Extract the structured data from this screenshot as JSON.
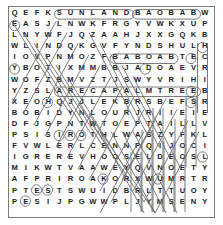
{
  "puzzle": {
    "type": "word-search",
    "title": "Word Search Puzzle Grid",
    "columns": 18,
    "rows": 18,
    "grid": [
      [
        "Q",
        "E",
        "F",
        "K",
        "S",
        "U",
        "N",
        "L",
        "A",
        "N",
        "D",
        "B",
        "A",
        "O",
        "B",
        "A",
        "B",
        "W"
      ],
      [
        "E",
        "A",
        "S",
        "J",
        "L",
        "N",
        "W",
        "K",
        "F",
        "R",
        "G",
        "Y",
        "V",
        "W",
        "K",
        "X",
        "U",
        "P"
      ],
      [
        "L",
        "N",
        "Y",
        "W",
        "F",
        "J",
        "Q",
        "Z",
        "A",
        "A",
        "H",
        "J",
        "X",
        "X",
        "G",
        "Q",
        "K",
        "B"
      ],
      [
        "W",
        "L",
        "I",
        "N",
        "D",
        "Q",
        "K",
        "G",
        "V",
        "F",
        "Y",
        "N",
        "D",
        "S",
        "H",
        "U",
        "L",
        "H"
      ],
      [
        "I",
        "O",
        "V",
        "P",
        "N",
        "M",
        "O",
        "Z",
        "F",
        "B",
        "A",
        "B",
        "O",
        "A",
        "B",
        "T",
        "E",
        "C"
      ],
      [
        "Y",
        "B",
        "O",
        "T",
        "I",
        "X",
        "M",
        "M",
        "B",
        "B",
        "J",
        "A",
        "D",
        "O",
        "A",
        "E",
        "V",
        "R"
      ],
      [
        "W",
        "O",
        "F",
        "Z",
        "B",
        "M",
        "V",
        "Z",
        "T",
        "J",
        "S",
        "W",
        "Y",
        "V",
        "R",
        "I",
        "H",
        "I"
      ],
      [
        "Y",
        "Z",
        "S",
        "L",
        "A",
        "R",
        "E",
        "C",
        "A",
        "P",
        "A",
        "L",
        "M",
        "T",
        "R",
        "E",
        "E",
        "B"
      ],
      [
        "X",
        "E",
        "O",
        "H",
        "Q",
        "J",
        "J",
        "L",
        "E",
        "K",
        "B",
        "R",
        "S",
        "B",
        "E",
        "F",
        "S",
        "R"
      ],
      [
        "B",
        "O",
        "B",
        "I",
        "D",
        "Y",
        "N",
        "L",
        "O",
        "U",
        "R",
        "J",
        "R",
        "I",
        "I",
        "E",
        "I",
        "E"
      ],
      [
        "D",
        "F",
        "J",
        "G",
        "P",
        "N",
        "T",
        "W",
        "T",
        "O",
        "E",
        "P",
        "T",
        "A",
        "I",
        "L",
        "L",
        "V"
      ],
      [
        "P",
        "S",
        "I",
        "S",
        "I",
        "R",
        "O",
        "T",
        "H",
        "L",
        "W",
        "A",
        "S",
        "Z",
        "Y",
        "F",
        "K",
        "L"
      ],
      [
        "F",
        "V",
        "W",
        "L",
        "E",
        "R",
        "L",
        "C",
        "E",
        "N",
        "N",
        "P",
        "Q",
        "I",
        "J",
        "O",
        "C",
        "I"
      ],
      [
        "I",
        "G",
        "R",
        "E",
        "R",
        "E",
        "V",
        "H",
        "O",
        "O",
        "S",
        "E",
        "L",
        "D",
        "E",
        "O",
        "S",
        "L"
      ],
      [
        "M",
        "I",
        "K",
        "W",
        "T",
        "V",
        "A",
        "A",
        "W",
        "E",
        "Y",
        "Q",
        "V",
        "N",
        "O",
        "E",
        "T",
        "Y"
      ],
      [
        "A",
        "F",
        "P",
        "R",
        "I",
        "R",
        "O",
        "A",
        "K",
        "O",
        "R",
        "X",
        "W",
        "U",
        "M",
        "R",
        "T",
        "R"
      ],
      [
        "P",
        "T",
        "E",
        "S",
        "T",
        "S",
        "W",
        "U",
        "I",
        "D",
        "B",
        "R",
        "L",
        "T",
        "T",
        "U",
        "O",
        "Y"
      ],
      [
        "P",
        "E",
        "S",
        "I",
        "J",
        "P",
        "G",
        "W",
        "W",
        "P",
        "L",
        "J",
        "Y",
        "M",
        "S",
        "E",
        "N",
        "Y"
      ]
    ],
    "found_words": [
      {
        "text": "SUNLAND",
        "row": 0,
        "col": 4,
        "length": 7,
        "direction": "horizontal"
      },
      {
        "text": "BAOBAB",
        "row": 0,
        "col": 11,
        "length": 6,
        "direction": "horizontal"
      },
      {
        "text": "BABOAB",
        "row": 4,
        "col": 9,
        "length": 6,
        "direction": "horizontal"
      },
      {
        "text": "ARECAPALMTREE",
        "row": 7,
        "col": 4,
        "length": 13,
        "direction": "horizontal"
      }
    ],
    "colors": {
      "grid_letter": "#1a1a1a",
      "mark": "#6d6d6d",
      "border": "#7b7b7b",
      "background": "#ffffff"
    }
  }
}
